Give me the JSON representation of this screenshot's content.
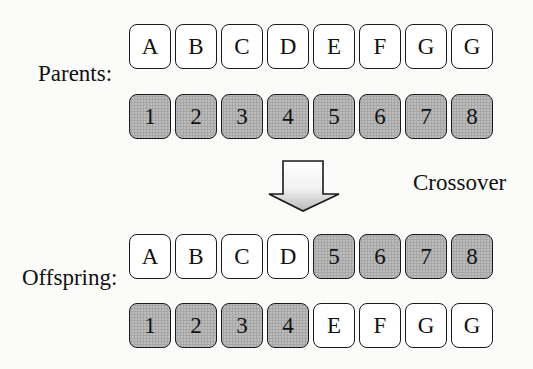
{
  "labels": {
    "parents": "Parents:",
    "offspring": "Offspring:",
    "operation": "Crossover"
  },
  "parents": [
    {
      "genes": [
        "A",
        "B",
        "C",
        "D",
        "E",
        "F",
        "G",
        "G"
      ],
      "shaded": [
        false,
        false,
        false,
        false,
        false,
        false,
        false,
        false
      ]
    },
    {
      "genes": [
        "1",
        "2",
        "3",
        "4",
        "5",
        "6",
        "7",
        "8"
      ],
      "shaded": [
        true,
        true,
        true,
        true,
        true,
        true,
        true,
        true
      ]
    }
  ],
  "offspring": [
    {
      "genes": [
        "A",
        "B",
        "C",
        "D",
        "5",
        "6",
        "7",
        "8"
      ],
      "shaded": [
        false,
        false,
        false,
        false,
        true,
        true,
        true,
        true
      ]
    },
    {
      "genes": [
        "1",
        "2",
        "3",
        "4",
        "E",
        "F",
        "G",
        "G"
      ],
      "shaded": [
        true,
        true,
        true,
        true,
        false,
        false,
        false,
        false
      ]
    }
  ],
  "colors": {
    "shaded_cell": "#bdbdbd",
    "plain_cell": "#ffffff",
    "border": "#1a1a1a"
  }
}
